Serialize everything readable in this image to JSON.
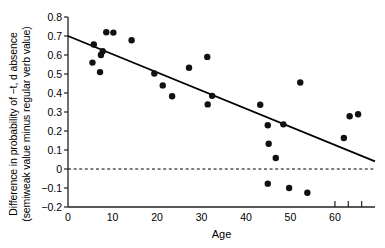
{
  "chart_data": {
    "type": "scatter",
    "title": "",
    "xlabel": "Age",
    "ylabel_line1": "Difference in probability of −t, d absence",
    "ylabel_line2": "(semiweak value minus regular verb value)",
    "xlim": [
      0,
      69
    ],
    "ylim": [
      -0.2,
      0.8
    ],
    "xticks": [
      0,
      10,
      20,
      30,
      40,
      50,
      60
    ],
    "xtick_labels": [
      "0",
      "10",
      "20",
      "30",
      "40",
      "50",
      "60"
    ],
    "yticks": [
      -0.2,
      -0.1,
      0,
      0.1,
      0.2,
      0.3,
      0.4,
      0.5,
      0.6,
      0.7,
      0.8
    ],
    "ytick_labels": [
      "−0.2",
      "−0.1",
      "0",
      "0.1",
      "0.2",
      "0.3",
      "0.4",
      "0.5",
      "0.6",
      "0.7",
      "0.8"
    ],
    "grid": false,
    "legend": "none",
    "extra_xticks": [
      60,
      63,
      66
    ],
    "points": [
      {
        "x": 5.5,
        "y": 0.56
      },
      {
        "x": 5.8,
        "y": 0.655
      },
      {
        "x": 7.2,
        "y": 0.51
      },
      {
        "x": 7.4,
        "y": 0.6
      },
      {
        "x": 7.8,
        "y": 0.62
      },
      {
        "x": 8.6,
        "y": 0.72
      },
      {
        "x": 10.2,
        "y": 0.718
      },
      {
        "x": 14.3,
        "y": 0.678
      },
      {
        "x": 19.4,
        "y": 0.503
      },
      {
        "x": 21.3,
        "y": 0.44
      },
      {
        "x": 23.4,
        "y": 0.383
      },
      {
        "x": 27.2,
        "y": 0.533
      },
      {
        "x": 31.3,
        "y": 0.59
      },
      {
        "x": 31.4,
        "y": 0.34
      },
      {
        "x": 32.4,
        "y": 0.385
      },
      {
        "x": 43.2,
        "y": 0.338
      },
      {
        "x": 44.9,
        "y": 0.23
      },
      {
        "x": 45.1,
        "y": 0.133
      },
      {
        "x": 44.9,
        "y": -0.077
      },
      {
        "x": 46.7,
        "y": 0.058
      },
      {
        "x": 48.4,
        "y": 0.235
      },
      {
        "x": 49.7,
        "y": -0.1
      },
      {
        "x": 52.2,
        "y": 0.455
      },
      {
        "x": 53.8,
        "y": -0.125
      },
      {
        "x": 62.0,
        "y": 0.163
      },
      {
        "x": 63.3,
        "y": 0.278
      },
      {
        "x": 65.2,
        "y": 0.288
      }
    ],
    "regression_line": {
      "x0": 0,
      "y0": 0.7,
      "x1": 69,
      "y1": 0.04
    },
    "zero_line": {
      "y": 0,
      "style": "dashed"
    },
    "marker": {
      "shape": "circle",
      "color": "#111111",
      "size_px": 6.4
    },
    "line_color": "#000000",
    "axis_color": "#222222"
  }
}
